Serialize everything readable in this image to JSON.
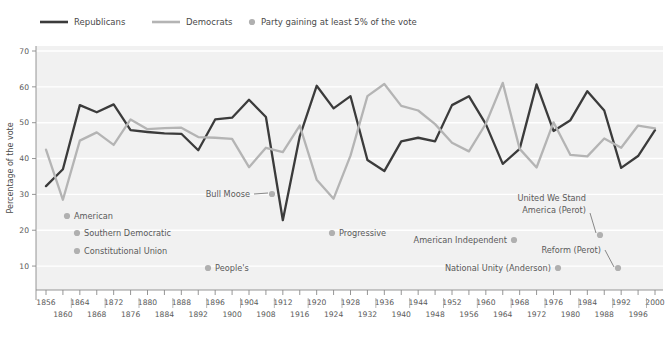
{
  "chart_data": {
    "type": "line",
    "title": "",
    "xlabel": "",
    "ylabel": "Percentage of the vote",
    "ylim": [
      5,
      70
    ],
    "yticks": [
      10,
      20,
      30,
      40,
      50,
      60,
      70
    ],
    "grid": true,
    "legend_position": "top-left",
    "x": [
      1856,
      1860,
      1864,
      1868,
      1872,
      1876,
      1880,
      1884,
      1888,
      1892,
      1896,
      1900,
      1904,
      1908,
      1912,
      1916,
      1920,
      1924,
      1928,
      1932,
      1936,
      1940,
      1944,
      1948,
      1952,
      1956,
      1960,
      1964,
      1968,
      1972,
      1976,
      1980,
      1984,
      1988,
      1992,
      1996,
      2000
    ],
    "xtick_labels_top": [
      "1856",
      "1864",
      "1872",
      "1880",
      "1888",
      "1896",
      "1904",
      "1912",
      "1920",
      "1928",
      "1936",
      "1944",
      "1952",
      "1960",
      "1968",
      "1976",
      "1984",
      "1992",
      "2000"
    ],
    "xtick_labels_bottom": [
      "1860",
      "1868",
      "1876",
      "1884",
      "1892",
      "1900",
      "1908",
      "1916",
      "1924",
      "1932",
      "1940",
      "1948",
      "1956",
      "1964",
      "1972",
      "1980",
      "1988",
      "1996"
    ],
    "series": [
      {
        "name": "Republicans",
        "color": "#3b3b3b",
        "values": [
          32.3,
          37.0,
          54.9,
          52.9,
          55.1,
          47.9,
          47.4,
          47.0,
          46.9,
          42.3,
          50.9,
          51.4,
          56.4,
          51.6,
          22.8,
          46.2,
          60.3,
          54.0,
          57.4,
          39.6,
          36.5,
          44.8,
          45.8,
          44.8,
          54.9,
          57.4,
          49.6,
          38.5,
          42.7,
          60.7,
          47.7,
          50.7,
          58.8,
          53.4,
          37.4,
          40.7,
          47.9
        ]
      },
      {
        "name": "Democrats",
        "color": "#b4b4b4",
        "values": [
          42.5,
          28.5,
          45.0,
          47.3,
          43.8,
          50.9,
          48.2,
          48.5,
          48.6,
          46.0,
          45.8,
          45.5,
          37.6,
          43.0,
          41.8,
          49.2,
          34.1,
          28.8,
          40.8,
          57.4,
          60.8,
          54.7,
          53.4,
          49.6,
          44.4,
          42.0,
          49.7,
          61.1,
          42.7,
          37.5,
          50.1,
          41.0,
          40.6,
          45.6,
          43.0,
          49.2,
          48.4
        ]
      }
    ],
    "marker_legend": "Party gaining at least 5% of the vote",
    "marker_color": "#b0b0b0",
    "annotations": [
      {
        "label": "American",
        "dot_x": 67,
        "dot_y": 216,
        "text_x": 74,
        "text_y": 219,
        "anchor": "start",
        "leader": false
      },
      {
        "label": "Southern Democratic",
        "dot_x": 77,
        "dot_y": 233,
        "text_x": 84,
        "text_y": 236,
        "anchor": "start",
        "leader": false
      },
      {
        "label": "Constitutional Union",
        "dot_x": 77,
        "dot_y": 251,
        "text_x": 84,
        "text_y": 254,
        "anchor": "start",
        "leader": false
      },
      {
        "label": "People's",
        "dot_x": 208,
        "dot_y": 268,
        "text_x": 215,
        "text_y": 271,
        "anchor": "start",
        "leader": false
      },
      {
        "label": "Bull Moose",
        "dot_x": 272,
        "dot_y": 194,
        "text_x": 250,
        "text_y": 197,
        "anchor": "end",
        "leader": true
      },
      {
        "label": "Progressive",
        "dot_x": 332,
        "dot_y": 233,
        "text_x": 339,
        "text_y": 236,
        "anchor": "start",
        "leader": false
      },
      {
        "label": "American Independent",
        "dot_x": 514,
        "dot_y": 240,
        "text_x": 507,
        "text_y": 243,
        "anchor": "end",
        "leader": false
      },
      {
        "label": "National Unity (Anderson)",
        "dot_x": 558,
        "dot_y": 268,
        "text_x": 551,
        "text_y": 271,
        "anchor": "end",
        "leader": false
      },
      {
        "label": "Reform (Perot)",
        "dot_x": 618,
        "dot_y": 268,
        "text_x": 601,
        "text_y": 253,
        "anchor": "end",
        "leader": true
      }
    ],
    "annotation_multiline": {
      "label_line1": "United We Stand",
      "label_line2": "America (Perot)",
      "dot_x": 600,
      "dot_y": 235,
      "text_x": 586,
      "text_y": 201,
      "anchor": "end"
    }
  },
  "legend": {
    "republicans_label": "Republicans",
    "democrats_label": "Democrats",
    "marker_label": "Party gaining at least 5% of the vote"
  },
  "axis": {
    "ylabel": "Percentage of the vote"
  },
  "source": {
    "text": ""
  }
}
